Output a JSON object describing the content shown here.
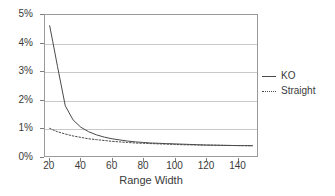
{
  "chart_data": {
    "type": "line",
    "title": "",
    "xlabel": "Range Width",
    "ylabel": "",
    "xlim": [
      17,
      153
    ],
    "ylim": [
      0,
      5
    ],
    "grid": true,
    "legend_position": "right",
    "x_ticks": [
      20,
      40,
      60,
      80,
      100,
      120,
      140
    ],
    "x_tick_labels": [
      "20",
      "40",
      "60",
      "80",
      "100",
      "120",
      "140"
    ],
    "y_ticks": [
      0,
      1,
      2,
      3,
      4,
      5
    ],
    "y_tick_labels": [
      "0%",
      "1%",
      "2%",
      "3%",
      "4%",
      "5%"
    ],
    "y_unit": "%",
    "series": [
      {
        "name": "KO",
        "style": "solid",
        "color": "#4a4a4a",
        "x": [
          20,
          22,
          25,
          30,
          35,
          40,
          45,
          50,
          55,
          60,
          65,
          70,
          75,
          80,
          85,
          90,
          95,
          100,
          105,
          110,
          115,
          120,
          125,
          130,
          135,
          140,
          145,
          150
        ],
        "values": [
          4.62,
          4.05,
          3.18,
          1.78,
          1.28,
          1.02,
          0.86,
          0.75,
          0.67,
          0.61,
          0.57,
          0.53,
          0.5,
          0.48,
          0.46,
          0.45,
          0.44,
          0.43,
          0.42,
          0.41,
          0.4,
          0.39,
          0.385,
          0.38,
          0.375,
          0.37,
          0.368,
          0.365
        ]
      },
      {
        "name": "Straight",
        "style": "dotted",
        "color": "#4a4a4a",
        "x": [
          20,
          22,
          25,
          30,
          35,
          40,
          45,
          50,
          55,
          60,
          65,
          70,
          75,
          80,
          85,
          90,
          95,
          100,
          105,
          110,
          115,
          120,
          125,
          130,
          135,
          140,
          145,
          150
        ],
        "values": [
          0.98,
          0.93,
          0.86,
          0.78,
          0.71,
          0.66,
          0.61,
          0.58,
          0.55,
          0.52,
          0.5,
          0.48,
          0.46,
          0.45,
          0.44,
          0.43,
          0.42,
          0.41,
          0.4,
          0.395,
          0.39,
          0.385,
          0.382,
          0.378,
          0.374,
          0.37,
          0.368,
          0.365
        ]
      }
    ]
  },
  "legend": {
    "items": [
      {
        "label": "KO"
      },
      {
        "label": "Straight"
      }
    ]
  },
  "colors": {
    "series_line": "#4a4a4a",
    "gridline": "#c9c9c9",
    "frame": "#9a9a9a",
    "text": "#3a3a3a",
    "background": "#ffffff"
  }
}
